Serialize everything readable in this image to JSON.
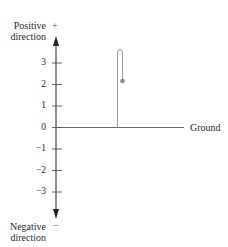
{
  "diagram": {
    "positive_label_line1": "Positive",
    "positive_label_line2": "direction",
    "positive_sign": "+",
    "negative_label_line1": "Negative",
    "negative_label_line2": "direction",
    "negative_sign": "−",
    "ground_label": "Ground",
    "ticks": [
      {
        "value": 3,
        "label": "3"
      },
      {
        "value": 2,
        "label": "2"
      },
      {
        "value": 1,
        "label": "1"
      },
      {
        "value": 0,
        "label": "0"
      },
      {
        "value": -1,
        "label": "−1"
      },
      {
        "value": -2,
        "label": "−2"
      },
      {
        "value": -3,
        "label": "−3"
      }
    ],
    "ball_position": 2.2,
    "pole_top": 3.7,
    "colors": {
      "axis": "#222222",
      "pole": "#9a9a9a",
      "ball": "#888888",
      "text": "#2a2a2a"
    }
  }
}
